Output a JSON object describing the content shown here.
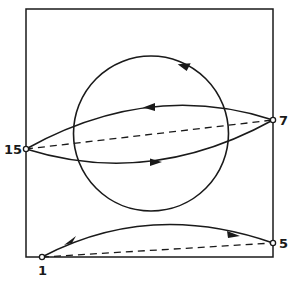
{
  "diagram": {
    "nodes": [
      {
        "id": "15",
        "label": "15",
        "x": 26,
        "y": 149
      },
      {
        "id": "7",
        "label": "7",
        "x": 273,
        "y": 120
      },
      {
        "id": "5",
        "label": "5",
        "x": 273,
        "y": 243
      },
      {
        "id": "1",
        "label": "1",
        "x": 42,
        "y": 257
      }
    ],
    "edges": [
      {
        "from": "7",
        "to": "15",
        "style": "solid-curve-upper",
        "arrow": "toward 15"
      },
      {
        "from": "15",
        "to": "7",
        "style": "solid-curve-lower",
        "arrow": "toward 7"
      },
      {
        "from": "15",
        "to": "7",
        "style": "dashed-straight"
      },
      {
        "from": "1",
        "to": "5",
        "style": "solid-curve",
        "arrows": [
          "near 1 pointing toward 1",
          "near 5 pointing toward 5"
        ]
      },
      {
        "from": "1",
        "to": "5",
        "style": "dashed-straight"
      }
    ],
    "circle": {
      "cx": 151,
      "cy": 133.5,
      "r": 77.5,
      "direction": "counterclockwise"
    },
    "frame": {
      "x": 26,
      "y": 9,
      "width": 247,
      "height": 248
    },
    "colors": {
      "ink": "#1a1a1a",
      "background": "#ffffff"
    }
  }
}
